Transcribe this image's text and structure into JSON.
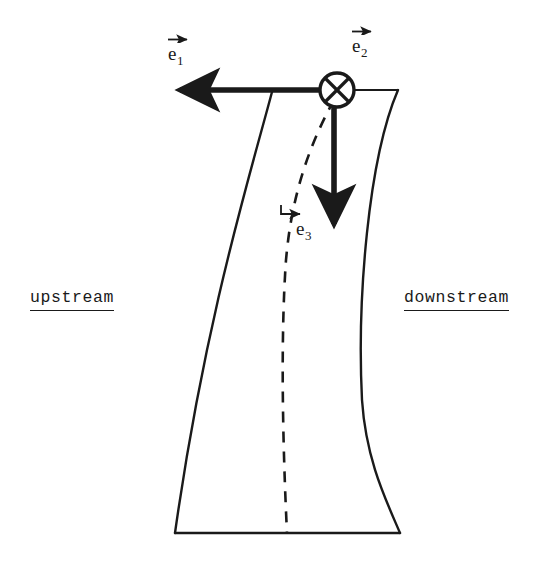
{
  "figure": {
    "background_color": "#ffffff",
    "ink_color": "#1a1a1a",
    "width": 549,
    "height": 581
  },
  "labels": {
    "upstream": "upstream",
    "downstream": "downstream",
    "e1_base": "e",
    "e1_sub": "1",
    "e2_base": "e",
    "e2_sub": "2",
    "e3_base": "e",
    "e3_sub": "3"
  },
  "icons": {
    "origin_marker": "circle-cross-into-page-icon",
    "e1_arrow": "arrow-left-icon",
    "e2_arrow": "arrow-down-icon",
    "e3_arrow": "arrow-right-bent-icon",
    "e1_accent": "vector-overarrow-icon",
    "e2_accent": "vector-overarrow-icon",
    "e3_accent": "vector-overarrow-icon"
  },
  "geometry": {
    "origin": {
      "x": 337,
      "y": 90
    },
    "origin_radius": 17,
    "e1_arrow": {
      "from_x": 337,
      "from_y": 90,
      "to_x": 172,
      "to_y": 90
    },
    "e2_arrow": {
      "from_x": 334,
      "from_y": 104,
      "to_x": 334,
      "to_y": 232
    },
    "top_edge": {
      "from_x": 272,
      "from_y": 90,
      "to_x": 398,
      "to_y": 90
    },
    "bottom_edge": {
      "from_x": 175,
      "from_y": 533,
      "to_x": 400,
      "to_y": 533
    },
    "left_boundary": "M272,92 C250,175 205,320 175,533",
    "right_boundary": "M398,90 C368,160 357,300 362,400 C366,460 386,500 400,533",
    "centerline_dashed": "M334,100 C312,140 292,190 286,260 C281,330 282,430 287,533",
    "dash_pattern": "11 9"
  },
  "colors": {
    "ink": "#1a1a1a",
    "paper": "#ffffff"
  }
}
